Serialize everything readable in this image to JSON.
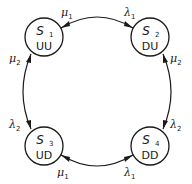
{
  "diagram": {
    "type": "state-transition",
    "states": [
      {
        "id": "S1",
        "symbol": "S",
        "index": "1",
        "code": "UU"
      },
      {
        "id": "S2",
        "symbol": "S",
        "index": "2",
        "code": "DU"
      },
      {
        "id": "S3",
        "symbol": "S",
        "index": "3",
        "code": "UD"
      },
      {
        "id": "S4",
        "symbol": "S",
        "index": "4",
        "code": "DD"
      }
    ],
    "transitions": [
      {
        "from": "S1",
        "to": "S2",
        "symbol": "λ",
        "index": "1"
      },
      {
        "from": "S2",
        "to": "S1",
        "symbol": "μ",
        "index": "1"
      },
      {
        "from": "S1",
        "to": "S3",
        "symbol": "λ",
        "index": "2"
      },
      {
        "from": "S3",
        "to": "S1",
        "symbol": "μ",
        "index": "2"
      },
      {
        "from": "S2",
        "to": "S4",
        "symbol": "λ",
        "index": "2"
      },
      {
        "from": "S4",
        "to": "S2",
        "symbol": "μ",
        "index": "2"
      },
      {
        "from": "S3",
        "to": "S4",
        "symbol": "λ",
        "index": "1"
      },
      {
        "from": "S4",
        "to": "S3",
        "symbol": "μ",
        "index": "1"
      }
    ]
  }
}
